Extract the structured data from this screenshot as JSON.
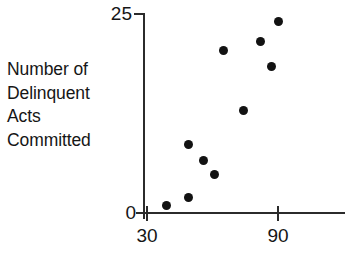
{
  "chart_data": {
    "type": "scatter",
    "title": "",
    "xlabel": "",
    "ylabel": "Number of Delinquent Acts Committed",
    "ylabel_lines": [
      "Number of",
      "Delinquent",
      "Acts",
      "Committed"
    ],
    "xlim": [
      30,
      125
    ],
    "ylim": [
      0,
      25
    ],
    "x_ticks": [
      30,
      90
    ],
    "x_tick_labels": [
      "30",
      "90"
    ],
    "y_ticks": [
      0,
      25
    ],
    "y_tick_labels": [
      "0",
      "25"
    ],
    "grid": false,
    "legend": null,
    "marker": "filled-circle",
    "marker_color": "#121212",
    "axis_color": "#2b2b2b",
    "points": [
      {
        "x": 39,
        "y": 0.9
      },
      {
        "x": 49,
        "y": 2.0
      },
      {
        "x": 56,
        "y": 6.6
      },
      {
        "x": 49,
        "y": 8.6
      },
      {
        "x": 61,
        "y": 4.9
      },
      {
        "x": 65,
        "y": 20.4
      },
      {
        "x": 74,
        "y": 12.9
      },
      {
        "x": 82,
        "y": 21.6
      },
      {
        "x": 87,
        "y": 18.4
      },
      {
        "x": 90,
        "y": 24.0
      }
    ]
  },
  "axes": {
    "y_caption": {
      "line1": "Number of",
      "line2": "Delinquent",
      "line3": "Acts",
      "line4": "Committed"
    },
    "y_top_label": "25",
    "y_origin_label": "0",
    "x_first_label": "30",
    "x_second_label": "90"
  }
}
